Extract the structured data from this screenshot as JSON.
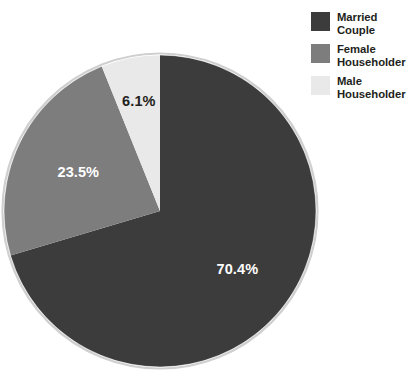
{
  "chart_data": {
    "type": "pie",
    "title": "",
    "subtitle": "",
    "categories": [
      "Married Couple",
      "Female Householder",
      "Male Householder"
    ],
    "values": [
      70.4,
      23.5,
      6.1
    ],
    "value_labels": [
      "70.4%",
      "23.5%",
      "6.1%"
    ],
    "unit": "percent",
    "start_angle_deg": 0,
    "direction": "clockwise",
    "legend_position": "top-right",
    "grid": false,
    "slice_colors": [
      "#3c3c3c",
      "#7d7d7d",
      "#e9e9e9"
    ],
    "slice_label_colors": [
      "#ffffff",
      "#ffffff",
      "#231f20"
    ],
    "outline_color": "#c9c9c9",
    "background": "#ffffff"
  },
  "legend": {
    "items": [
      {
        "label_line1": "Married",
        "label_line2": "Couple",
        "color": "#3c3c3c",
        "swatch_name": "legend-swatch-married-couple"
      },
      {
        "label_line1": "Female",
        "label_line2": "Householder",
        "color": "#7d7d7d",
        "swatch_name": "legend-swatch-female-householder"
      },
      {
        "label_line1": "Male",
        "label_line2": "Householder",
        "color": "#e9e9e9",
        "swatch_name": "legend-swatch-male-householder"
      }
    ]
  },
  "pie_labels": {
    "married": "70.4%",
    "female": "23.5%",
    "male": "6.1%"
  }
}
